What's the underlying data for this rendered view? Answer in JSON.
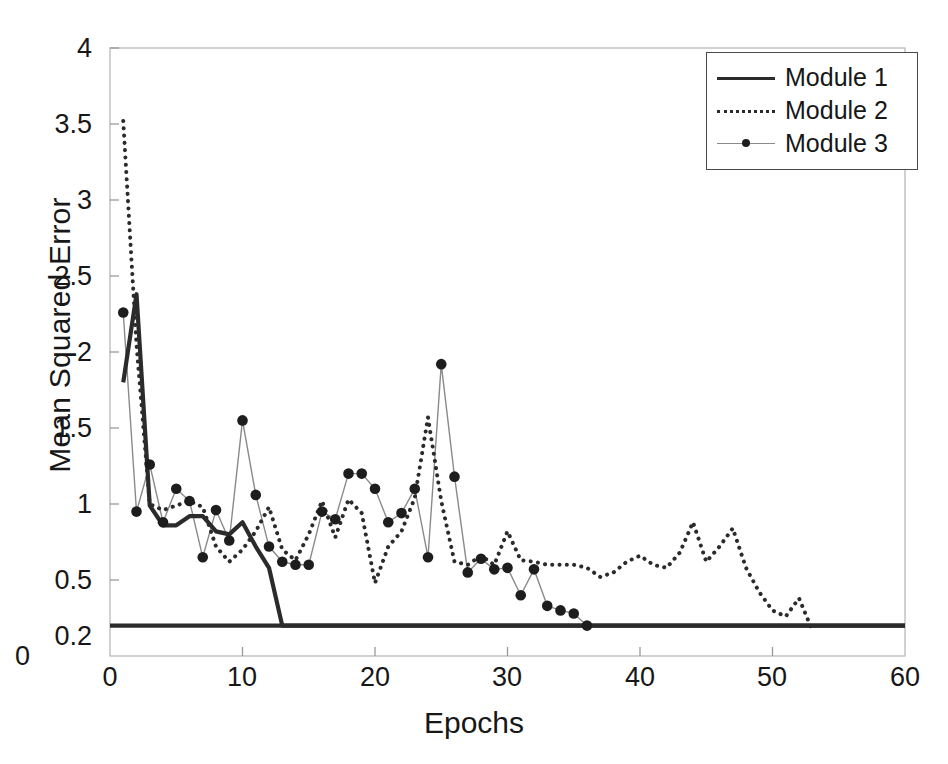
{
  "chart_data": {
    "type": "line",
    "title": "",
    "xlabel": "Epochs",
    "ylabel": "Mean Squared Error",
    "xlim": [
      0,
      60
    ],
    "ylim": [
      0,
      4
    ],
    "xticks": [
      "0",
      "10",
      "20",
      "30",
      "40",
      "50",
      "60"
    ],
    "xtick_values": [
      0,
      10,
      20,
      30,
      40,
      50,
      60
    ],
    "yticks": [
      "0",
      "0.2",
      "0.5",
      "1",
      "1.5",
      "2",
      "2.5",
      "3",
      "3.5",
      "4"
    ],
    "ytick_values": [
      0,
      0.2,
      0.5,
      1,
      1.5,
      2,
      2.5,
      3,
      3.5,
      4
    ],
    "grid": false,
    "legend_position": "top-right",
    "legend_entries": [
      "Module 1",
      "Module 2",
      "Module 3"
    ],
    "series": [
      {
        "name": "Module 1",
        "style": "solid",
        "marker": "none",
        "color": "#2b2b2b",
        "x": [
          1,
          2,
          3,
          4,
          5,
          6,
          7,
          8,
          9,
          10,
          11,
          12,
          13,
          60
        ],
        "values": [
          1.8,
          2.38,
          0.99,
          0.86,
          0.86,
          0.92,
          0.92,
          0.82,
          0.8,
          0.88,
          0.72,
          0.58,
          0.2,
          0.2
        ]
      },
      {
        "name": "Module 2",
        "style": "dotted",
        "marker": "none",
        "color": "#2b2b2b",
        "x": [
          1,
          2,
          3,
          4,
          5,
          6,
          7,
          8,
          9,
          10,
          11,
          12,
          13,
          14,
          15,
          16,
          17,
          18,
          19,
          20,
          21,
          22,
          23,
          24,
          25,
          26,
          27,
          28,
          29,
          30,
          31,
          32,
          33,
          34,
          35,
          36,
          37,
          38,
          39,
          40,
          41,
          42,
          43,
          44,
          45,
          46,
          47,
          48,
          49,
          50,
          51,
          52,
          53
        ],
        "values": [
          3.52,
          2.05,
          1.0,
          0.96,
          0.99,
          1.02,
          0.98,
          0.72,
          0.62,
          0.7,
          0.82,
          0.98,
          0.7,
          0.63,
          0.8,
          1.02,
          0.78,
          1.03,
          0.94,
          0.48,
          0.72,
          0.82,
          1.04,
          1.57,
          1.02,
          0.62,
          0.6,
          0.66,
          0.6,
          0.82,
          0.63,
          0.62,
          0.6,
          0.6,
          0.6,
          0.58,
          0.52,
          0.55,
          0.62,
          0.66,
          0.6,
          0.58,
          0.68,
          0.88,
          0.62,
          0.72,
          0.84,
          0.58,
          0.42,
          0.3,
          0.26,
          0.38,
          0.17
        ]
      },
      {
        "name": "Module 3",
        "style": "thin-line-with-dots",
        "marker": "dot",
        "color": "#1d1d1d",
        "line_color": "#8a8a8a",
        "x": [
          1,
          2,
          3,
          4,
          5,
          6,
          7,
          8,
          9,
          10,
          11,
          12,
          13,
          14,
          15,
          16,
          17,
          18,
          19,
          20,
          21,
          22,
          23,
          24,
          25,
          26,
          27,
          28,
          29,
          30,
          31,
          32,
          33,
          34,
          35,
          36
        ],
        "values": [
          2.26,
          0.95,
          1.26,
          0.88,
          1.1,
          1.02,
          0.65,
          0.96,
          0.76,
          1.55,
          1.06,
          0.72,
          0.62,
          0.6,
          0.6,
          0.95,
          0.9,
          1.2,
          1.2,
          1.1,
          0.88,
          0.94,
          1.1,
          0.65,
          1.92,
          1.18,
          0.55,
          0.64,
          0.57,
          0.58,
          0.4,
          0.57,
          0.33,
          0.3,
          0.28,
          0.2
        ]
      }
    ],
    "reference_line": {
      "label": "0.2",
      "value": 0.2,
      "style": "solid",
      "color": "#2b2b2b"
    }
  },
  "axes": {
    "ylabel": "Mean Squared Error",
    "xlabel": "Epochs"
  }
}
